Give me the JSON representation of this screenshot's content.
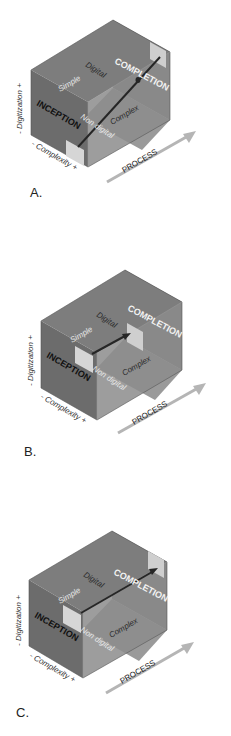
{
  "figure": {
    "panels": [
      {
        "id": "A",
        "letter": "A.",
        "labels": {
          "inception": "INCEPTION",
          "completion": "COMPLETION",
          "digital": "Digital",
          "simple": "Simple",
          "non_digital": "Non digital",
          "complex": "Complex",
          "process": "PROCESS",
          "digitization_axis": "- Digitization +",
          "complexity_axis": "- Complexity +"
        },
        "path_description": "diagonal from inception (simple, non digital) to completion (complex, digital)"
      },
      {
        "id": "B",
        "letter": "B.",
        "labels": {
          "inception": "INCEPTION",
          "completion": "COMPLETION",
          "digital": "Digital",
          "simple": "Simple",
          "non_digital": "Non digital",
          "complex": "Complex",
          "process": "PROCESS",
          "digitization_axis": "- Digitization +",
          "complexity_axis": "- Complexity +"
        },
        "path_description": "short path from inception (simple, digital) toward completion at mid depth"
      },
      {
        "id": "C",
        "letter": "C.",
        "labels": {
          "inception": "INCEPTION",
          "completion": "COMPLETION",
          "digital": "Digital",
          "simple": "Simple",
          "non_digital": "Non digital",
          "complex": "Complex",
          "process": "PROCESS",
          "digitization_axis": "- Digitization +",
          "complexity_axis": "- Complexity +"
        },
        "path_description": "path from inception (simple, digital) along the top to completion (complex, digital)"
      }
    ],
    "colors": {
      "left_face": "#6e6e6e",
      "top_face": "#7c7c7c",
      "right_face": "#8a8a8a",
      "back_face": "#757575",
      "floor": "#999999",
      "inner_square": "#d4d4d4",
      "arrow": "#2a2a2a",
      "process_arrow": "#b8b8b8"
    }
  }
}
